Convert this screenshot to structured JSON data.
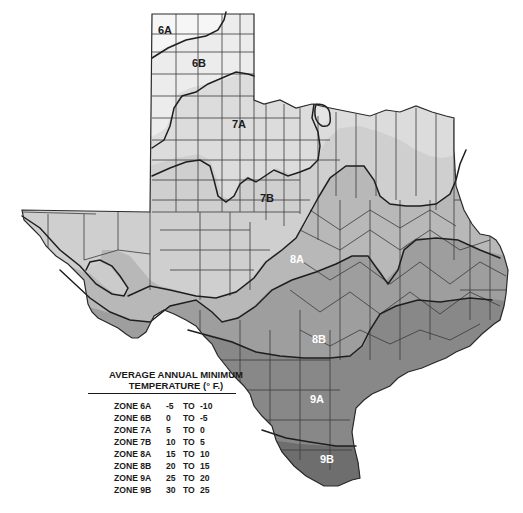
{
  "map": {
    "title": "Texas Plant Hardiness Zones",
    "colors": {
      "6A": "#f4f4f4",
      "6B": "#ececec",
      "7A": "#dcdcdc",
      "7B": "#cfcfcf",
      "8A": "#b8b8b8",
      "8B": "#9e9e9e",
      "9A": "#888888",
      "9B": "#707070",
      "county_lines": "#3a3a3a",
      "zone_lines": "#1e1e1e"
    },
    "zone_labels": [
      {
        "id": "6A",
        "text": "6A",
        "x": 158,
        "y": 30,
        "color": "#1a1a1a"
      },
      {
        "id": "6B",
        "text": "6B",
        "x": 192,
        "y": 56,
        "color": "#1a1a1a"
      },
      {
        "id": "7A",
        "text": "7A",
        "x": 232,
        "y": 119,
        "color": "#1a1a1a"
      },
      {
        "id": "7B",
        "text": "7B",
        "x": 260,
        "y": 192,
        "color": "#1a1a1a"
      },
      {
        "id": "8A",
        "text": "8A",
        "x": 290,
        "y": 254,
        "color": "#ffffff"
      },
      {
        "id": "8B",
        "text": "8B",
        "x": 312,
        "y": 333,
        "color": "#ffffff"
      },
      {
        "id": "9A",
        "text": "9A",
        "x": 310,
        "y": 394,
        "color": "#ffffff"
      },
      {
        "id": "9B",
        "text": "9B",
        "x": 320,
        "y": 454,
        "color": "#ffffff"
      }
    ]
  },
  "legend": {
    "title_line1": "AVERAGE ANNUAL MINIMUM",
    "title_line2": "TEMPERATURE (° F.)",
    "rows": [
      {
        "zone": "ZONE 6A",
        "from": "-5",
        "to_word": "TO",
        "to": "-10"
      },
      {
        "zone": "ZONE 6B",
        "from": "0",
        "to_word": "TO",
        "to": "-5"
      },
      {
        "zone": "ZONE 7A",
        "from": "5",
        "to_word": "TO",
        "to": "0"
      },
      {
        "zone": "ZONE 7B",
        "from": "10",
        "to_word": "TO",
        "to": "5"
      },
      {
        "zone": "ZONE 8A",
        "from": "15",
        "to_word": "TO",
        "to": "10"
      },
      {
        "zone": "ZONE 8B",
        "from": "20",
        "to_word": "TO",
        "to": "15"
      },
      {
        "zone": "ZONE 9A",
        "from": "25",
        "to_word": "TO",
        "to": "20"
      },
      {
        "zone": "ZONE 9B",
        "from": "30",
        "to_word": "TO",
        "to": "25"
      }
    ]
  }
}
